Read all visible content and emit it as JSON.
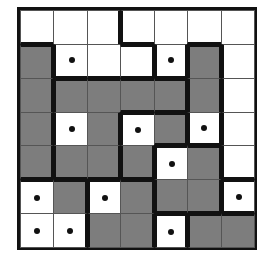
{
  "puzzle": {
    "rows": 7,
    "cols": 7,
    "colors": {
      "shaded": "#7d7d7d",
      "unshaded": "#ffffff",
      "border": "#111111"
    },
    "grid": [
      "WWWWWWW",
      "GWWWWGW",
      "GGGGGGW",
      "GWGWGWW",
      "GGGGWGW",
      "WGWGGGW",
      "WWGGWGG"
    ],
    "dots": [
      [
        1,
        1
      ],
      [
        1,
        4
      ],
      [
        3,
        1
      ],
      [
        3,
        3
      ],
      [
        3,
        5
      ],
      [
        4,
        4
      ],
      [
        5,
        0
      ],
      [
        5,
        2
      ],
      [
        5,
        6
      ],
      [
        6,
        0
      ],
      [
        6,
        1
      ],
      [
        6,
        4
      ]
    ],
    "regions": [
      "AAABBBB",
      "CAAABCB",
      "CDDDDCB",
      "CDDEECB",
      "CDDEFFB",
      "GGHHFFI",
      "GGHHJKK"
    ]
  }
}
